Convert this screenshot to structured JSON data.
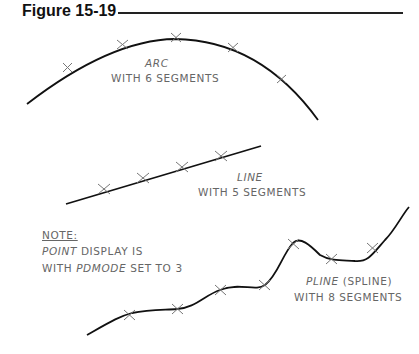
{
  "figure": {
    "title": "Figure 15-19"
  },
  "labels": {
    "arc": {
      "name": "ARC",
      "detail": "WITH 6 SEGMENTS"
    },
    "line": {
      "name": "LINE",
      "detail": "WITH 5 SEGMENTS"
    },
    "pline": {
      "name": "PLINE",
      "name_suffix": " (SPLINE)",
      "detail": "WITH 8 SEGMENTS"
    },
    "note": {
      "heading": "NOTE:",
      "line1_italic": "POINT",
      "line1_rest": " DISPLAY IS",
      "line2_prefix": "WITH ",
      "line2_italic": "PDMODE",
      "line2_rest": " SET TO 3"
    }
  },
  "colors": {
    "stroke": "#111111",
    "marker": "#777777",
    "text": "#666666"
  }
}
